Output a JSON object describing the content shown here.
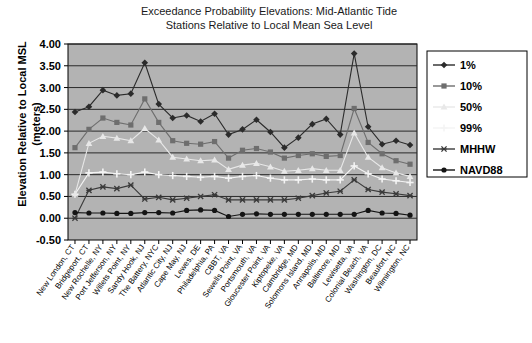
{
  "chart_data": {
    "type": "line",
    "title": "Exceedance Probability Elevations: Mid-Atlantic Tide Stations Relative to Local Mean Sea Level",
    "title_line1": "Exceedance Probability Elevations: Mid-Atlantic Tide",
    "title_line2": "Stations Relative to Local Mean Sea Level",
    "ylabel": "Elevation Relative to Local MSL (meters)",
    "ylabel_line1": "Elevation Relative to Local MSL",
    "ylabel_line2": "(meters)",
    "xlabel": "",
    "ylim": [
      -0.5,
      4.0
    ],
    "ytick_step": 0.5,
    "ytick_labels": [
      "4.00",
      "3.50",
      "3.00",
      "2.50",
      "2.00",
      "1.50",
      "1.00",
      "0.50",
      "0.00",
      "-0.50"
    ],
    "ytick_values": [
      4.0,
      3.5,
      3.0,
      2.5,
      2.0,
      1.5,
      1.0,
      0.5,
      0.0,
      -0.5
    ],
    "grid": true,
    "legend_position": "right",
    "plot_background": "#b3b3b3",
    "categories": [
      "New London, CT",
      "Bridgeport, CT",
      "New Rochelle, NY",
      "Port Jefferson, NY",
      "Willets Point, NY",
      "Sandy Hook, NJ",
      "The Battery, NYC",
      "Atlantic City, NJ",
      "Cape May, NJ",
      "Lewes, DE",
      "Philadelphia, PA",
      "CBBT, VA",
      "Sewells Point, VA",
      "Portsmouth, VA",
      "Gloucester Point, VA",
      "Kiptopeke, VA",
      "Cambridge, MD",
      "Solomons Island, MD",
      "Annapolis, MD",
      "Baltimore, MD",
      "Lewisetta, VA",
      "Colonial Beach, VA",
      "Washington, DC",
      "Beaufort, NC",
      "Wilmington, NC"
    ],
    "series": [
      {
        "name": "1%",
        "color": "#2b2b2b",
        "marker": "diamond",
        "values": [
          2.44,
          2.56,
          2.94,
          2.82,
          2.86,
          3.57,
          2.62,
          2.3,
          2.36,
          2.22,
          2.4,
          1.92,
          2.04,
          2.26,
          1.98,
          1.62,
          1.85,
          2.16,
          2.28,
          1.92,
          3.78,
          2.1,
          1.7,
          1.78,
          1.68
        ]
      },
      {
        "name": "10%",
        "color": "#6e6e6e",
        "marker": "square",
        "values": [
          1.62,
          2.04,
          2.3,
          2.2,
          2.14,
          2.74,
          2.2,
          1.78,
          1.72,
          1.7,
          1.76,
          1.38,
          1.56,
          1.6,
          1.52,
          1.38,
          1.44,
          1.48,
          1.42,
          1.44,
          2.52,
          1.74,
          1.48,
          1.32,
          1.24
        ]
      },
      {
        "name": "50%",
        "color": "#e8e8e8",
        "marker": "triangle",
        "values": [
          0.55,
          1.72,
          1.88,
          1.84,
          1.78,
          2.06,
          1.8,
          1.4,
          1.36,
          1.32,
          1.34,
          1.12,
          1.22,
          1.26,
          1.18,
          1.08,
          1.1,
          1.14,
          1.1,
          1.1,
          1.96,
          1.4,
          1.16,
          1.04,
          0.96
        ]
      },
      {
        "name": "99%",
        "color": "#f4f4f4",
        "marker": "plus",
        "values": [
          0.55,
          1.04,
          1.06,
          1.02,
          1.0,
          1.06,
          1.0,
          0.98,
          0.96,
          0.94,
          0.96,
          0.92,
          0.96,
          0.98,
          0.92,
          0.88,
          0.88,
          0.9,
          0.88,
          0.88,
          1.2,
          1.02,
          0.9,
          0.86,
          0.82
        ]
      },
      {
        "name": "MHHW",
        "color": "#3a3a3a",
        "marker": "star",
        "values": [
          0.0,
          0.64,
          0.72,
          0.68,
          0.76,
          0.44,
          0.48,
          0.42,
          0.46,
          0.5,
          0.54,
          0.42,
          0.42,
          0.42,
          0.42,
          0.42,
          0.46,
          0.52,
          0.58,
          0.62,
          0.88,
          0.66,
          0.6,
          0.56,
          0.52
        ]
      },
      {
        "name": "NAVD88",
        "color": "#141414",
        "marker": "circle",
        "values": [
          0.13,
          0.12,
          0.12,
          0.11,
          0.11,
          0.13,
          0.13,
          0.12,
          0.18,
          0.19,
          0.18,
          0.04,
          0.09,
          0.1,
          0.09,
          0.09,
          0.09,
          0.09,
          0.09,
          0.09,
          0.09,
          0.18,
          0.12,
          0.11,
          0.07
        ]
      }
    ],
    "legend_entries": [
      {
        "label": "1%",
        "color": "#2b2b2b",
        "marker": "diamond"
      },
      {
        "label": "10%",
        "color": "#6e6e6e",
        "marker": "square"
      },
      {
        "label": "50%",
        "color": "#e8e8e8",
        "marker": "triangle"
      },
      {
        "label": "99%",
        "color": "#f4f4f4",
        "marker": "plus"
      },
      {
        "label": "MHHW",
        "color": "#3a3a3a",
        "marker": "star"
      },
      {
        "label": "NAVD88",
        "color": "#141414",
        "marker": "circle"
      }
    ]
  }
}
